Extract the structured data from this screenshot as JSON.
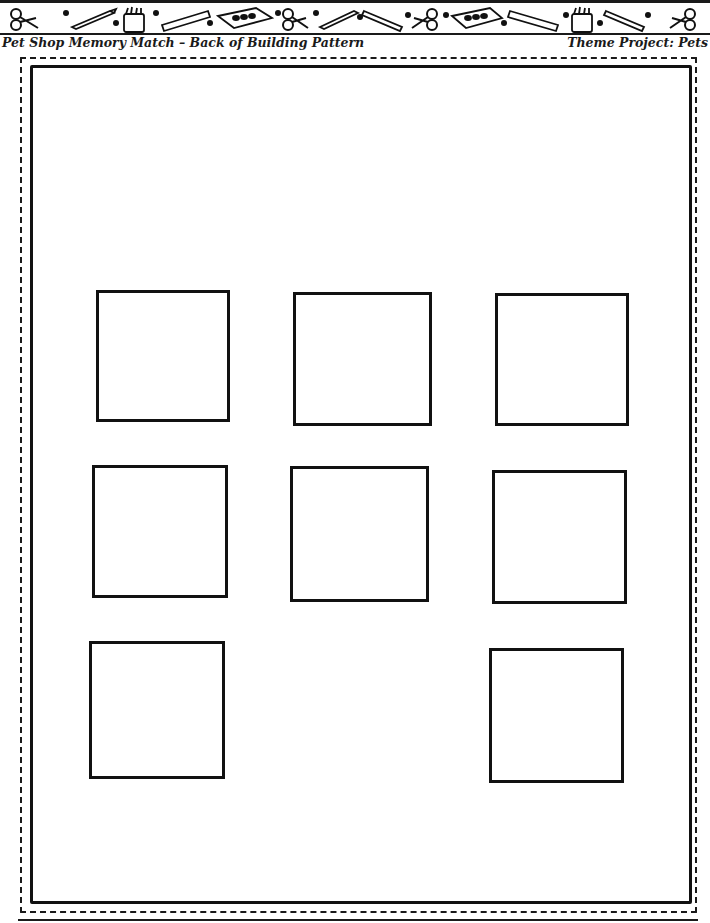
{
  "header": {
    "title": "Pet Shop Memory Match – Back of Building Pattern",
    "theme": "Theme Project: Pets",
    "banner_icons": [
      "scissors-icon",
      "pencil-icon",
      "crayon-box-icon",
      "ruler-icon",
      "paint-set-icon",
      "scissors-icon",
      "pencil-icon",
      "pencil-icon",
      "scissors-icon",
      "paint-set-icon",
      "ruler-icon",
      "crayon-box-icon",
      "pencil-icon",
      "scissors-icon"
    ]
  },
  "pattern": {
    "frame_style": "dashed outer cut line with solid inner border",
    "window_count": 8,
    "windows": [
      {
        "id": 1,
        "row": 1,
        "col": 1,
        "x": 96,
        "y": 290,
        "w": 134,
        "h": 132
      },
      {
        "id": 2,
        "row": 1,
        "col": 2,
        "x": 293,
        "y": 292,
        "w": 139,
        "h": 134
      },
      {
        "id": 3,
        "row": 1,
        "col": 3,
        "x": 495,
        "y": 293,
        "w": 134,
        "h": 133
      },
      {
        "id": 4,
        "row": 2,
        "col": 1,
        "x": 92,
        "y": 465,
        "w": 136,
        "h": 133
      },
      {
        "id": 5,
        "row": 2,
        "col": 2,
        "x": 290,
        "y": 466,
        "w": 139,
        "h": 136
      },
      {
        "id": 6,
        "row": 2,
        "col": 3,
        "x": 492,
        "y": 470,
        "w": 135,
        "h": 134
      },
      {
        "id": 7,
        "row": 3,
        "col": 1,
        "x": 89,
        "y": 641,
        "w": 136,
        "h": 138
      },
      {
        "id": 8,
        "row": 3,
        "col": 3,
        "x": 489,
        "y": 648,
        "w": 135,
        "h": 135
      }
    ]
  }
}
